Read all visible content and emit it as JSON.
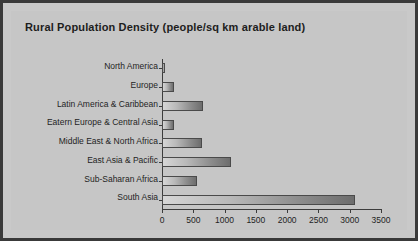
{
  "chart_data": {
    "type": "bar",
    "orientation": "horizontal",
    "title": "Rural Population Density (people/sq km arable land)",
    "xlabel": "",
    "ylabel": "",
    "xlim": [
      0,
      3500
    ],
    "xticks": [
      0,
      500,
      1000,
      1500,
      2000,
      2500,
      3000,
      3500
    ],
    "xticklabels": [
      "0",
      "500",
      "1000",
      "1500",
      "2000",
      "2500",
      "3000",
      "3500"
    ],
    "grid": false,
    "legend": false,
    "categories": [
      "North America",
      "Europe",
      "Latin America & Caribbean",
      "Eatern Europe & Central Asia",
      "Middle East & North Africa",
      "East Asia & Pacific",
      "Sub-Saharan Africa",
      "South Asia"
    ],
    "values": [
      50,
      190,
      650,
      190,
      640,
      1110,
      560,
      3090
    ],
    "bar_fill_light": "#d6d6d6",
    "bar_fill_dark": "#6d6d6d",
    "bar_border": "#4a4a4a",
    "background": "#c6c6c6",
    "frame_color": "#3a3a3a",
    "axis_color": "#3c3c3c",
    "text_color": "#1f1f1f"
  }
}
